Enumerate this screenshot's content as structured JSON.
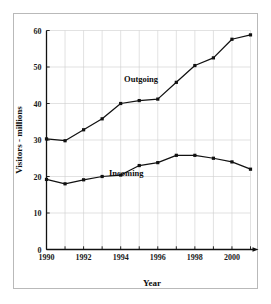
{
  "chart_data": {
    "type": "line",
    "title": "",
    "xlabel": "Year",
    "ylabel": "Visitors - millions",
    "x": [
      1990,
      1991,
      1992,
      1993,
      1994,
      1995,
      1996,
      1997,
      1998,
      1999,
      2000,
      2001
    ],
    "xlim": [
      1990,
      2001
    ],
    "ylim": [
      0,
      60
    ],
    "xticks": [
      1990,
      1992,
      1994,
      1996,
      1998,
      2000
    ],
    "xticklabels": [
      "1990",
      "1992",
      "1994",
      "1996",
      "1998",
      "2000"
    ],
    "yticks": [
      0,
      10,
      20,
      30,
      40,
      50,
      60
    ],
    "yticklabels": [
      "0",
      "10",
      "20",
      "30",
      "40",
      "50",
      "60"
    ],
    "grid": true,
    "grid_color": "#cfcfcf",
    "legend": "inline-labels",
    "marker": "square",
    "line_color": "#111111",
    "series": [
      {
        "name": "Outgoing",
        "label": "Outgoing",
        "label_x": 1995.1,
        "label_y": 46.0,
        "values": [
          30.3,
          29.8,
          32.8,
          35.8,
          40.0,
          40.8,
          41.2,
          45.8,
          50.4,
          52.5,
          57.6,
          58.8
        ]
      },
      {
        "name": "Incoming",
        "label": "Incoming",
        "label_x": 1994.3,
        "label_y": 20.2,
        "values": [
          19.2,
          18.0,
          19.1,
          20.0,
          20.4,
          23.0,
          23.8,
          25.8,
          25.8,
          25.0,
          24.0,
          22.0
        ]
      }
    ]
  },
  "figure": {
    "frame_color": "#b9b9b9",
    "background": "#ffffff",
    "axis_color": "#111111"
  }
}
